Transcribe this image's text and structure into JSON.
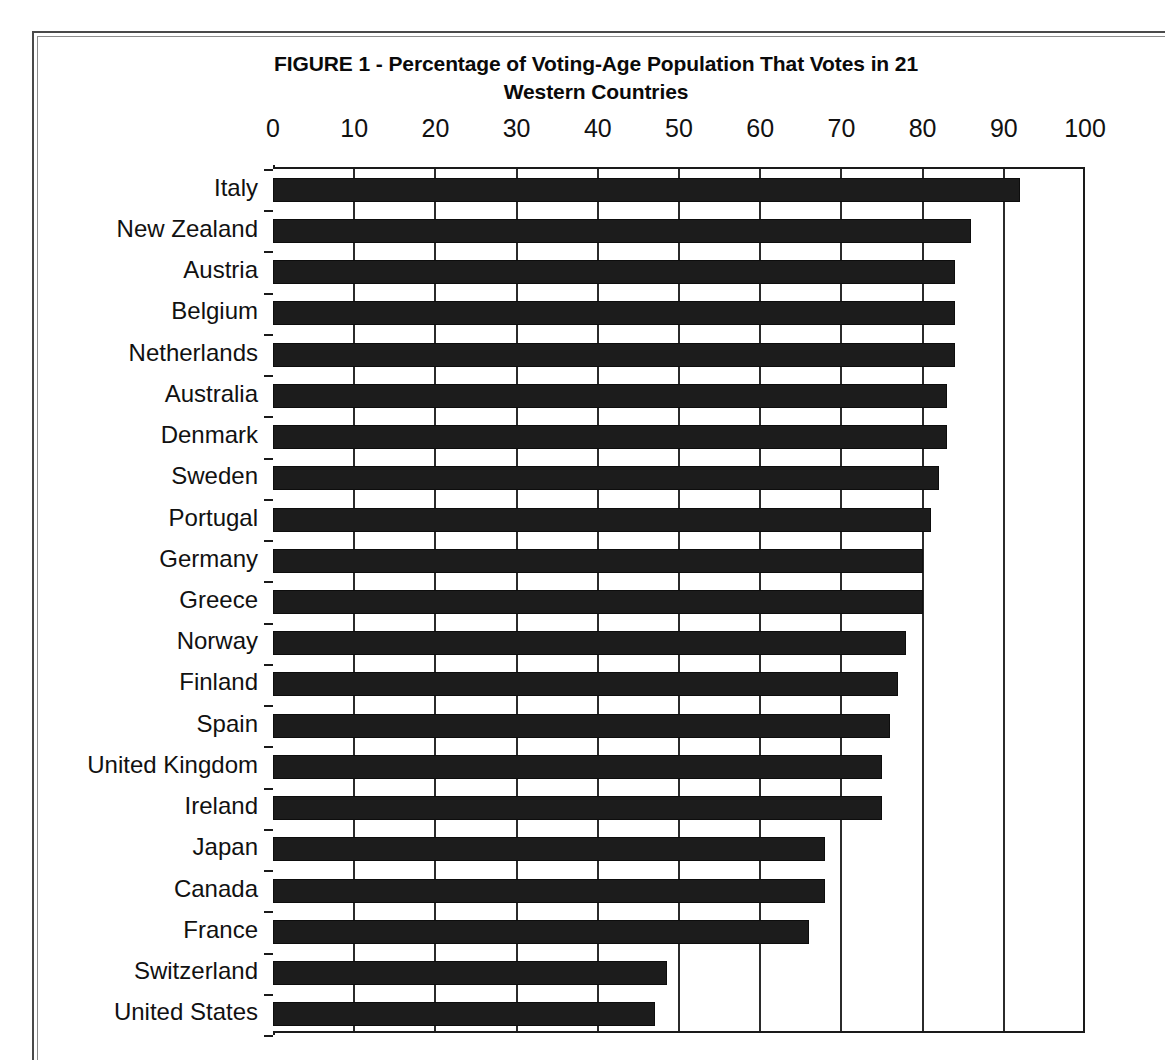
{
  "chart_data": {
    "type": "bar",
    "orientation": "horizontal",
    "title": "FIGURE 1 - Percentage of Voting-Age Population That Votes in 21 Western Countries",
    "title_line1": "FIGURE 1 - Percentage of Voting-Age Population That Votes in 21",
    "title_line2": "Western Countries",
    "xlabel": "",
    "ylabel": "",
    "xlim": [
      0,
      100
    ],
    "xticks": [
      0,
      10,
      20,
      30,
      40,
      50,
      60,
      70,
      80,
      90,
      100
    ],
    "xtick_labels": [
      "0",
      "10",
      "20",
      "30",
      "40",
      "50",
      "60",
      "70",
      "80",
      "90",
      "100"
    ],
    "grid": true,
    "grid_axis": "x",
    "legend": false,
    "bar_color": "#1c1c1c",
    "categories": [
      "Italy",
      "New Zealand",
      "Austria",
      "Belgium",
      "Netherlands",
      "Australia",
      "Denmark",
      "Sweden",
      "Portugal",
      "Germany",
      "Greece",
      "Norway",
      "Finland",
      "Spain",
      "United Kingdom",
      "Ireland",
      "Japan",
      "Canada",
      "France",
      "Switzerland",
      "United States"
    ],
    "values": [
      92,
      86,
      84,
      84,
      84,
      83,
      83,
      82,
      81,
      80,
      80,
      78,
      77,
      76,
      75,
      75,
      68,
      68,
      66,
      48.5,
      47
    ]
  }
}
